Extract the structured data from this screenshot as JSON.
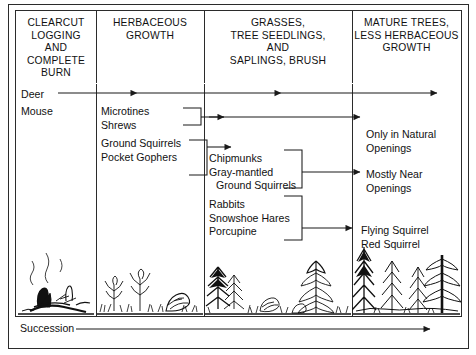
{
  "diagram": {
    "title": "Succession",
    "footer_label": "Succession",
    "columns": [
      {
        "id": "clearcut",
        "header_lines": [
          "CLEARCUT",
          "LOGGING",
          "AND",
          "COMPLETE",
          "BURN"
        ],
        "scene": "burned-stumps-logs-smoke"
      },
      {
        "id": "herbaceous",
        "header_lines": [
          "HERBACEOUS",
          "GROWTH"
        ],
        "scene": "herbs-grasses-forbs"
      },
      {
        "id": "grasses-seedlings",
        "header_lines": [
          "GRASSES,",
          "TREE SEEDLINGS,",
          "AND",
          "SAPLINGS, BRUSH"
        ],
        "scene": "brush-saplings-small-conifers"
      },
      {
        "id": "mature-trees",
        "header_lines": [
          "MATURE TREES,",
          "LESS HERBACEOUS",
          "GROWTH"
        ],
        "scene": "mature-conifer-forest"
      }
    ],
    "species_blocks": [
      {
        "id": "deer",
        "lines": [
          "Deer"
        ]
      },
      {
        "id": "mouse",
        "lines": [
          "Mouse"
        ]
      },
      {
        "id": "microtines-shrews",
        "lines": [
          "Microtines",
          "Shrews"
        ]
      },
      {
        "id": "ground-squirrels-pocket-gophers",
        "lines": [
          "Ground Squirrels",
          "Pocket Gophers"
        ]
      },
      {
        "id": "chipmunks-gray-mantled",
        "lines": [
          "Chipmunks",
          "Gray-mantled",
          "Ground Squirrels"
        ],
        "indent_last": true
      },
      {
        "id": "rabbits-hares-porcupine",
        "lines": [
          "Rabbits",
          "Snowshoe Hares",
          "Porcupine"
        ]
      },
      {
        "id": "only-natural-openings",
        "lines": [
          "Only in Natural",
          "Openings"
        ]
      },
      {
        "id": "mostly-near-openings",
        "lines": [
          "Mostly Near",
          "Openings"
        ]
      },
      {
        "id": "flying-red-squirrel",
        "lines": [
          "Flying Squirrel",
          "Red Squirrel"
        ]
      }
    ]
  }
}
